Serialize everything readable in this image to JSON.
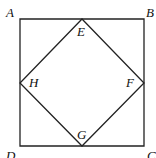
{
  "diagram": {
    "outer_square": [
      "A",
      "B",
      "C",
      "D"
    ],
    "inner_square": [
      "E",
      "F",
      "G",
      "H"
    ],
    "labels": {
      "A": "A",
      "B": "B",
      "C": "C",
      "D": "D",
      "E": "E",
      "F": "F",
      "G": "G",
      "H": "H"
    },
    "midpoints": {
      "E": "AB",
      "F": "BC",
      "G": "CD",
      "H": "DA"
    }
  }
}
